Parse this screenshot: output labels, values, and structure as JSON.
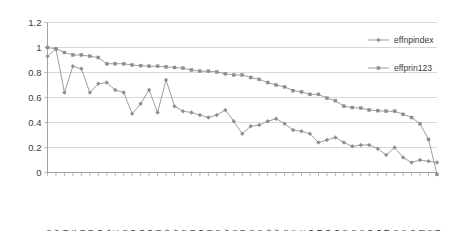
{
  "chart_data": {
    "type": "line",
    "title": "",
    "subtitle": "",
    "xlabel": "",
    "ylabel": "",
    "ylim": [
      0,
      1.2
    ],
    "ytick_labels": [
      "0",
      "0.2",
      "0.4",
      "0.6",
      "0.8",
      "1",
      "1.2"
    ],
    "ytick_values": [
      0,
      0.2,
      0.4,
      0.6,
      0.8,
      1,
      1.2
    ],
    "grid": true,
    "legend_position": "top-right",
    "categories": [
      "Sweden",
      "Norway",
      "Australi",
      "Denmark",
      "Iceland",
      "Finland",
      "Netherla",
      "USA",
      "UK",
      "Luxembou",
      "Belgium",
      "Canada",
      "NewZeala",
      "Switzerl",
      "KoreaRep",
      "Germany",
      "France",
      "Ireland",
      "Austria",
      "Portugal",
      "Spain",
      "Italy",
      "Japan",
      "Israel",
      "Greece",
      "Bahrain",
      "CzechRep",
      "Hungary",
      "SlovakRe",
      "Qatar",
      "UAE",
      "Libya",
      "Kuwait",
      "SaudiAra",
      "Tunisia",
      "Lebanon",
      "Jordan",
      "Iran",
      "Algeria",
      "Syria",
      "Egypt",
      "Palestin",
      "Oman",
      "Morocco",
      "Iraq",
      "Yemen",
      "Djibouti"
    ],
    "series": [
      {
        "name": "effnpindex",
        "marker": "diamond",
        "color": "#8c8c8c",
        "values": [
          0.93,
          0.99,
          0.64,
          0.85,
          0.83,
          0.64,
          0.71,
          0.72,
          0.66,
          0.64,
          0.47,
          0.55,
          0.66,
          0.48,
          0.74,
          0.53,
          0.49,
          0.48,
          0.46,
          0.44,
          0.46,
          0.5,
          0.41,
          0.31,
          0.37,
          0.38,
          0.41,
          0.43,
          0.39,
          0.34,
          0.33,
          0.31,
          0.24,
          0.26,
          0.28,
          0.24,
          0.21,
          0.22,
          0.22,
          0.19,
          0.14,
          0.2,
          0.12,
          0.08,
          0.1,
          0.09,
          0.08
        ]
      },
      {
        "name": "effprin123",
        "marker": "square",
        "color": "#8c8c8c",
        "values": [
          1.0,
          0.99,
          0.96,
          0.94,
          0.94,
          0.93,
          0.92,
          0.87,
          0.87,
          0.87,
          0.86,
          0.855,
          0.85,
          0.85,
          0.845,
          0.84,
          0.835,
          0.82,
          0.81,
          0.81,
          0.805,
          0.79,
          0.78,
          0.78,
          0.76,
          0.745,
          0.72,
          0.7,
          0.685,
          0.655,
          0.645,
          0.625,
          0.625,
          0.595,
          0.575,
          0.53,
          0.52,
          0.515,
          0.5,
          0.495,
          0.49,
          0.49,
          0.465,
          0.44,
          0.39,
          0.265,
          -0.015
        ]
      }
    ],
    "legend": [
      {
        "label": "effnpindex",
        "marker": "diamond"
      },
      {
        "label": "effprin123",
        "marker": "square"
      }
    ]
  },
  "extra_ticks_note": ""
}
